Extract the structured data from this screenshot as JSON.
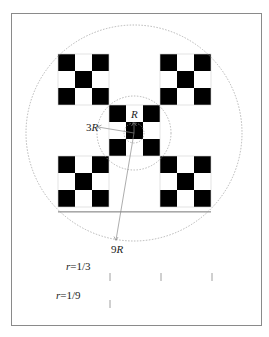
{
  "figure": {
    "frame": {
      "x": 11,
      "y": 13,
      "width": 250,
      "height": 312,
      "stroke": "#888888"
    },
    "grid": {
      "origin_x": 58,
      "origin_y": 54,
      "cell": 17,
      "size": 9,
      "fill_color": "#000000",
      "black_cells": [
        [
          0,
          0
        ],
        [
          0,
          2
        ],
        [
          1,
          1
        ],
        [
          2,
          0
        ],
        [
          2,
          2
        ],
        [
          0,
          6
        ],
        [
          0,
          8
        ],
        [
          1,
          7
        ],
        [
          2,
          6
        ],
        [
          2,
          8
        ],
        [
          3,
          3
        ],
        [
          3,
          5
        ],
        [
          4,
          4
        ],
        [
          5,
          3
        ],
        [
          5,
          5
        ],
        [
          6,
          0
        ],
        [
          6,
          2
        ],
        [
          7,
          1
        ],
        [
          8,
          0
        ],
        [
          8,
          2
        ],
        [
          6,
          6
        ],
        [
          6,
          8
        ],
        [
          7,
          7
        ],
        [
          8,
          6
        ],
        [
          8,
          8
        ]
      ]
    },
    "circles": [
      {
        "name": "radius-R-circle",
        "cx": 134,
        "cy": 133,
        "r": 10
      },
      {
        "name": "radius-3R-circle",
        "cx": 134,
        "cy": 133,
        "r": 37
      },
      {
        "name": "radius-9R-circle",
        "cx": 134,
        "cy": 133,
        "r": 108
      }
    ],
    "labels": {
      "R": "R",
      "three_R_num": "3",
      "three_R_var": "R",
      "nine_R_num": "9",
      "nine_R_var": "R"
    },
    "scales": [
      {
        "label_var": "r",
        "label_rest": "=1/3",
        "ticks_x": [
          110,
          161,
          212
        ],
        "tick_y1": 273,
        "tick_y2": 281
      },
      {
        "label_var": "r",
        "label_rest": "=1/9",
        "ticks_x": [
          110
        ],
        "tick_y1": 300,
        "tick_y2": 308
      }
    ]
  }
}
